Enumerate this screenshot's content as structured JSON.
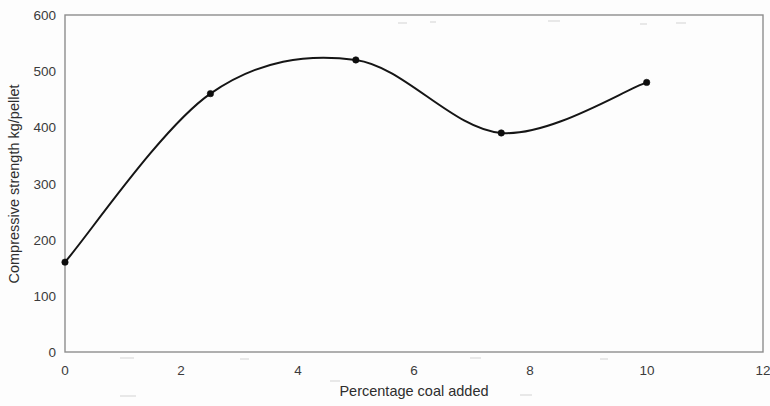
{
  "chart_data": {
    "type": "line",
    "title": "",
    "subtitle": "",
    "xlabel": "Percentage coal added",
    "ylabel": "Compressive strength kg/pellet",
    "xlim": [
      0,
      12
    ],
    "ylim": [
      0,
      600
    ],
    "x_ticks": [
      0,
      2,
      4,
      6,
      8,
      10,
      12
    ],
    "y_ticks": [
      0,
      100,
      200,
      300,
      400,
      500,
      600
    ],
    "x_tick_labels": [
      "0",
      "2",
      "4",
      "6",
      "8",
      "10",
      "12"
    ],
    "y_tick_labels": [
      "0",
      "100",
      "200",
      "300",
      "400",
      "500",
      "600"
    ],
    "grid": false,
    "legend": false,
    "legend_position": "none",
    "markers": "filled-circle",
    "line_style": "smooth-spline",
    "series": [
      {
        "name": "Compressive strength",
        "color": "#151515",
        "x": [
          0,
          2.5,
          5,
          7.5,
          10
        ],
        "values": [
          160,
          460,
          520,
          390,
          480
        ],
        "points": [
          {
            "x": 0,
            "y": 160
          },
          {
            "x": 2.5,
            "y": 460
          },
          {
            "x": 5,
            "y": 520
          },
          {
            "x": 7.5,
            "y": 390
          },
          {
            "x": 10,
            "y": 480
          }
        ]
      }
    ],
    "annotations": [],
    "colors": {
      "line": "#151515",
      "marker": "#0d0d0d",
      "frame": "#8d8d8d",
      "text": "#2e2e2e",
      "background": "#fdfdfd"
    }
  }
}
